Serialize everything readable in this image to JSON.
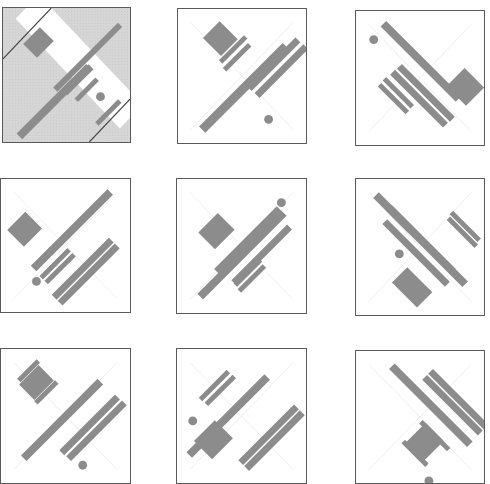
{
  "grid": {
    "rows": 3,
    "cols": 3
  },
  "colors": {
    "shape": "#8c8c8c",
    "border": "#5a5a5a",
    "guide": "#eeeeee",
    "hatch": "#d6d6d6",
    "background": "#ffffff"
  },
  "tiles": [
    {
      "id": "tile-1-1",
      "x": 2,
      "y": 7,
      "w": 129,
      "h": 136,
      "highlighted": true,
      "shapes": [
        {
          "t": "rect",
          "cx": 36,
          "cy": 35,
          "w": 24,
          "h": 20,
          "r": -45
        },
        {
          "t": "rect",
          "cx": 86,
          "cy": 50,
          "w": 93,
          "h": 6,
          "r": -45
        },
        {
          "t": "rect",
          "cx": 76,
          "cy": 73,
          "w": 38,
          "h": 7,
          "r": -45
        },
        {
          "t": "rect",
          "cx": 52,
          "cy": 95,
          "w": 100,
          "h": 8,
          "r": -45
        },
        {
          "t": "rect",
          "cx": 85,
          "cy": 83,
          "w": 30,
          "h": 5,
          "r": -45
        },
        {
          "t": "rect",
          "cx": 107,
          "cy": 106,
          "w": 33,
          "h": 5,
          "r": -45
        },
        {
          "t": "circle",
          "cx": 99,
          "cy": 90,
          "r": 4.5
        }
      ]
    },
    {
      "id": "tile-1-2",
      "x": 177,
      "y": 8,
      "w": 130,
      "h": 136,
      "highlighted": false,
      "shapes": [
        {
          "t": "rect",
          "cx": 43,
          "cy": 30,
          "w": 24,
          "h": 26,
          "r": -45
        },
        {
          "t": "rect",
          "cx": 56,
          "cy": 41,
          "w": 36,
          "h": 5,
          "r": -45
        },
        {
          "t": "rect",
          "cx": 60,
          "cy": 49,
          "w": 36,
          "h": 5,
          "r": -45
        },
        {
          "t": "rect",
          "cx": 67,
          "cy": 80,
          "w": 120,
          "h": 9,
          "r": -45
        },
        {
          "t": "rect",
          "cx": 97,
          "cy": 56,
          "w": 70,
          "h": 7,
          "r": -45
        },
        {
          "t": "rect",
          "cx": 105,
          "cy": 63,
          "w": 70,
          "h": 7,
          "r": -45
        },
        {
          "t": "circle",
          "cx": 92,
          "cy": 112,
          "r": 4.5
        }
      ]
    },
    {
      "id": "tile-1-3",
      "x": 355,
      "y": 10,
      "w": 130,
      "h": 136,
      "highlighted": false,
      "shapes": [
        {
          "t": "rect",
          "cx": 66,
          "cy": 51,
          "w": 108,
          "h": 8,
          "r": 45
        },
        {
          "t": "rect",
          "cx": 111,
          "cy": 77,
          "w": 28,
          "h": 26,
          "r": 45
        },
        {
          "t": "rect",
          "cx": 71,
          "cy": 83,
          "w": 76,
          "h": 7,
          "r": 45
        },
        {
          "t": "rect",
          "cx": 64,
          "cy": 89,
          "w": 76,
          "h": 7,
          "r": 45
        },
        {
          "t": "rect",
          "cx": 43,
          "cy": 83,
          "w": 40,
          "h": 5,
          "r": 45
        },
        {
          "t": "rect",
          "cx": 38,
          "cy": 89,
          "w": 40,
          "h": 5,
          "r": 45
        },
        {
          "t": "circle",
          "cx": 18,
          "cy": 29,
          "r": 4.5
        }
      ]
    },
    {
      "id": "tile-2-1",
      "x": 0,
      "y": 178,
      "w": 131,
      "h": 135,
      "highlighted": false,
      "shapes": [
        {
          "t": "rect",
          "cx": 24,
          "cy": 51,
          "w": 26,
          "h": 24,
          "r": -45
        },
        {
          "t": "rect",
          "cx": 72,
          "cy": 52,
          "w": 110,
          "h": 8,
          "r": -45
        },
        {
          "t": "rect",
          "cx": 55,
          "cy": 86,
          "w": 40,
          "h": 5,
          "r": -45
        },
        {
          "t": "rect",
          "cx": 60,
          "cy": 91,
          "w": 40,
          "h": 5,
          "r": -45
        },
        {
          "t": "rect",
          "cx": 83,
          "cy": 91,
          "w": 82,
          "h": 7,
          "r": -45
        },
        {
          "t": "rect",
          "cx": 89,
          "cy": 97,
          "w": 82,
          "h": 7,
          "r": -45
        },
        {
          "t": "circle",
          "cx": 36,
          "cy": 104,
          "r": 4.5
        }
      ]
    },
    {
      "id": "tile-2-2",
      "x": 176,
      "y": 178,
      "w": 131,
      "h": 136,
      "highlighted": false,
      "shapes": [
        {
          "t": "rect",
          "cx": 40,
          "cy": 53,
          "w": 28,
          "h": 24,
          "r": -45
        },
        {
          "t": "rect",
          "cx": 72,
          "cy": 62,
          "w": 90,
          "h": 7,
          "r": -45
        },
        {
          "t": "rect",
          "cx": 66,
          "cy": 77,
          "w": 120,
          "h": 8,
          "r": -45
        },
        {
          "t": "rect",
          "cx": 86,
          "cy": 77,
          "w": 80,
          "h": 7,
          "r": -45
        },
        {
          "t": "rect",
          "cx": 72,
          "cy": 95,
          "w": 36,
          "h": 5,
          "r": -45
        },
        {
          "t": "rect",
          "cx": 76,
          "cy": 101,
          "w": 36,
          "h": 5,
          "r": -45
        },
        {
          "t": "circle",
          "cx": 106,
          "cy": 24,
          "r": 4.5
        }
      ]
    },
    {
      "id": "tile-2-3",
      "x": 355,
      "y": 178,
      "w": 130,
      "h": 138,
      "highlighted": false,
      "shapes": [
        {
          "t": "rect",
          "cx": 38,
          "cy": 34,
          "w": 50,
          "h": 8,
          "r": 45
        },
        {
          "t": "rect",
          "cx": 72,
          "cy": 68,
          "w": 110,
          "h": 8,
          "r": 45
        },
        {
          "t": "rect",
          "cx": 61,
          "cy": 75,
          "w": 90,
          "h": 7,
          "r": 45
        },
        {
          "t": "rect",
          "cx": 67,
          "cy": 62,
          "w": 90,
          "h": 7,
          "r": 45
        },
        {
          "t": "rect",
          "cx": 108,
          "cy": 54,
          "w": 40,
          "h": 5,
          "r": 45
        },
        {
          "t": "rect",
          "cx": 111,
          "cy": 48,
          "w": 40,
          "h": 5,
          "r": 45
        },
        {
          "t": "rect",
          "cx": 57,
          "cy": 110,
          "w": 36,
          "h": 22,
          "r": 45
        },
        {
          "t": "circle",
          "cx": 44,
          "cy": 76,
          "r": 4.5
        }
      ]
    },
    {
      "id": "tile-3-1",
      "x": 0,
      "y": 348,
      "w": 131,
      "h": 136,
      "highlighted": false,
      "shapes": [
        {
          "t": "rect",
          "cx": 28,
          "cy": 22,
          "w": 28,
          "h": 5,
          "r": -45
        },
        {
          "t": "rect",
          "cx": 36,
          "cy": 34,
          "w": 28,
          "h": 22,
          "r": -45
        },
        {
          "t": "rect",
          "cx": 46,
          "cy": 44,
          "w": 30,
          "h": 5,
          "r": -45
        },
        {
          "t": "rect",
          "cx": 62,
          "cy": 72,
          "w": 110,
          "h": 8,
          "r": -45
        },
        {
          "t": "rect",
          "cx": 90,
          "cy": 77,
          "w": 80,
          "h": 7,
          "r": -45
        },
        {
          "t": "rect",
          "cx": 97,
          "cy": 83,
          "w": 80,
          "h": 7,
          "r": -45
        },
        {
          "t": "circle",
          "cx": 83,
          "cy": 118,
          "r": 4.5
        }
      ]
    },
    {
      "id": "tile-3-1b",
      "x": 176,
      "y": 348,
      "w": 131,
      "h": 136,
      "highlighted": false,
      "shapes": [
        {
          "t": "rect",
          "cx": 38,
          "cy": 37,
          "w": 40,
          "h": 5,
          "r": -45
        },
        {
          "t": "rect",
          "cx": 44,
          "cy": 42,
          "w": 40,
          "h": 5,
          "r": -45
        },
        {
          "t": "rect",
          "cx": 52,
          "cy": 68,
          "w": 112,
          "h": 8,
          "r": -45
        },
        {
          "t": "rect",
          "cx": 37,
          "cy": 92,
          "w": 30,
          "h": 26,
          "r": -45
        },
        {
          "t": "rect",
          "cx": 93,
          "cy": 87,
          "w": 80,
          "h": 7,
          "r": -45
        },
        {
          "t": "rect",
          "cx": 99,
          "cy": 93,
          "w": 80,
          "h": 7,
          "r": -45
        },
        {
          "t": "circle",
          "cx": 16,
          "cy": 73,
          "r": 4.5
        }
      ]
    },
    {
      "id": "tile-3-3",
      "x": 355,
      "y": 350,
      "w": 130,
      "h": 134,
      "highlighted": false,
      "shapes": [
        {
          "t": "rect",
          "cx": 76,
          "cy": 55,
          "w": 112,
          "h": 8,
          "r": 45
        },
        {
          "t": "rect",
          "cx": 98,
          "cy": 55,
          "w": 80,
          "h": 7,
          "r": 45
        },
        {
          "t": "rect",
          "cx": 104,
          "cy": 49,
          "w": 80,
          "h": 7,
          "r": 45
        },
        {
          "t": "rect",
          "cx": 70,
          "cy": 92,
          "w": 26,
          "h": 28,
          "r": 45
        },
        {
          "t": "rect",
          "cx": 80,
          "cy": 86,
          "w": 40,
          "h": 5,
          "r": 45
        },
        {
          "t": "rect",
          "cx": 60,
          "cy": 104,
          "w": 34,
          "h": 5,
          "r": 45
        },
        {
          "t": "circle",
          "cx": 74,
          "cy": 132,
          "r": 4.5
        }
      ]
    }
  ]
}
